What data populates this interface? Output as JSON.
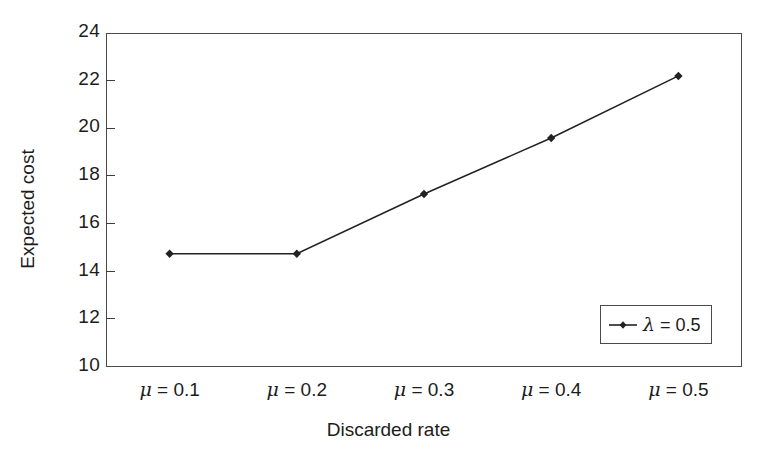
{
  "chart_data": {
    "type": "line",
    "title": "",
    "subtitle": "",
    "xlabel": "Discarded rate",
    "ylabel": "Expected cost",
    "categories": [
      "μ = 0.1",
      "μ = 0.2",
      "μ = 0.3",
      "μ = 0.4",
      "μ = 0.5"
    ],
    "x": [
      0.1,
      0.2,
      0.3,
      0.4,
      0.5
    ],
    "series": [
      {
        "name": "λ = 0.5",
        "values": [
          14.75,
          14.75,
          17.25,
          19.6,
          22.2
        ],
        "color": "#222222",
        "marker": "diamond",
        "linestyle": "solid"
      }
    ],
    "ylim": [
      10,
      24
    ],
    "yticks": [
      10,
      12,
      14,
      16,
      18,
      20,
      22,
      24
    ],
    "ytick_labels": [
      "10",
      "12",
      "14",
      "16",
      "18",
      "20",
      "22",
      "24"
    ],
    "xticks": [],
    "grid": false,
    "legend_position": "lower right",
    "legend_entries": [
      "λ = 0.5"
    ],
    "annotations": [],
    "frame": {
      "background": "#ffffff",
      "border_color": "#4a4a4a"
    }
  },
  "axes": {
    "y_title": "Expected cost",
    "x_title": "Discarded rate"
  },
  "legend": {
    "entry_label": "λ = 0.5"
  }
}
